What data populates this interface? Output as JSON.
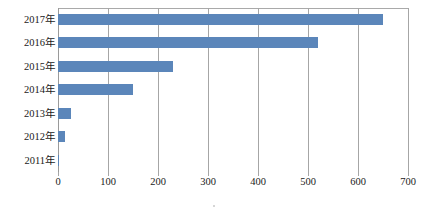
{
  "chart_data": {
    "type": "bar",
    "orientation": "horizontal",
    "title": "",
    "subtitle": "",
    "xlabel": "",
    "ylabel": "",
    "categories": [
      "2011年",
      "2012年",
      "2013年",
      "2014年",
      "2015年",
      "2016年",
      "2017年"
    ],
    "values": [
      2,
      13,
      25,
      150,
      230,
      520,
      650
    ],
    "series": [
      {
        "name": "",
        "values": [
          2,
          13,
          25,
          150,
          230,
          520,
          650
        ],
        "color": "#5b86ba"
      }
    ],
    "xlim": [
      0,
      700
    ],
    "ylim": null,
    "xticks": [
      0,
      100,
      200,
      300,
      400,
      500,
      600,
      700
    ],
    "xtick_labels": [
      "0",
      "100",
      "200",
      "300",
      "400",
      "500",
      "600",
      "700"
    ],
    "grid": {
      "vertical": true,
      "horizontal": false,
      "color": "#a6a6a6"
    },
    "legend": {
      "visible": false,
      "position": "none",
      "entries": []
    },
    "annotations": [],
    "data_labels": false,
    "bar_color": "#5b86ba",
    "axis_color": "#a9a9a9",
    "text_color": "#1a1a1a"
  },
  "colors": {
    "bar": "#5b86ba",
    "gridline": "#a6a6a6",
    "axis": "#9a9a9a",
    "text": "#1a1a1a",
    "background": "#ffffff"
  }
}
